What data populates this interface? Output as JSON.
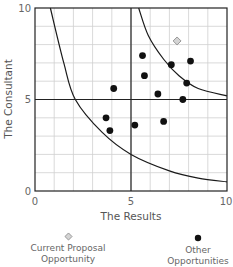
{
  "chart_data": {
    "type": "scatter",
    "title": "",
    "xlabel": "The Results",
    "ylabel": "The Consultant",
    "xlim": [
      0,
      10
    ],
    "ylim": [
      0,
      10
    ],
    "x_ticks": [
      "0",
      "5",
      "10"
    ],
    "y_ticks": [
      "0",
      "5",
      "10"
    ],
    "grid": true,
    "grid_step": 1,
    "quadrant_lines": {
      "x": 5,
      "y": 5
    },
    "curves": [
      {
        "name": "lower-boundary",
        "description": "hyperbolic curve from top-left to bottom-right",
        "points": [
          [
            0.8,
            10
          ],
          [
            1.5,
            7
          ],
          [
            2.1,
            5
          ],
          [
            3.5,
            3.2
          ],
          [
            5,
            2
          ],
          [
            7,
            1.1
          ],
          [
            8.5,
            0.7
          ],
          [
            10,
            0.5
          ]
        ]
      },
      {
        "name": "upper-boundary",
        "description": "hyperbolic curve in upper-right quadrant",
        "points": [
          [
            5.4,
            10
          ],
          [
            5.9,
            8.5
          ],
          [
            6.7,
            7.2
          ],
          [
            7.5,
            6.3
          ],
          [
            8.5,
            5.6
          ],
          [
            10,
            5.2
          ]
        ]
      }
    ],
    "series": [
      {
        "name": "Current Proposal Opportunity",
        "marker": "diamond",
        "color": "#bbbbbb",
        "points": [
          [
            7.4,
            8.2
          ]
        ]
      },
      {
        "name": "Other Opportunities",
        "marker": "circle",
        "color": "#111111",
        "points": [
          [
            5.6,
            7.4
          ],
          [
            7.1,
            6.9
          ],
          [
            8.1,
            7.1
          ],
          [
            5.7,
            6.3
          ],
          [
            7.9,
            5.9
          ],
          [
            4.1,
            5.6
          ],
          [
            6.4,
            5.3
          ],
          [
            7.7,
            5.0
          ],
          [
            3.7,
            4.0
          ],
          [
            3.9,
            3.3
          ],
          [
            5.2,
            3.6
          ],
          [
            6.7,
            3.8
          ]
        ]
      }
    ],
    "legend": [
      {
        "label_line1": "Current Proposal",
        "label_line2": "Opportunity",
        "marker": "diamond"
      },
      {
        "label_line1": "Other",
        "label_line2": "Opportunities",
        "marker": "circle"
      }
    ],
    "legend_position": "bottom"
  }
}
